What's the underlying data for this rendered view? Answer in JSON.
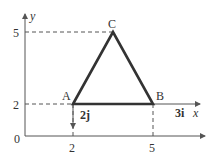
{
  "figure": {
    "axes": {
      "x_label": "x",
      "y_label": "y",
      "origin_label": "0",
      "x_ticks": [
        "2",
        "5"
      ],
      "y_ticks": [
        "2",
        "5"
      ]
    },
    "points": {
      "A": {
        "label": "A",
        "x": 2,
        "y": 2
      },
      "B": {
        "label": "B",
        "x": 5,
        "y": 2
      },
      "C": {
        "label": "C",
        "x": 3.5,
        "y": 5
      }
    },
    "vectors": {
      "i_vec": "3i",
      "j_vec": "2j"
    },
    "colors": {
      "triangle": "#333333",
      "axes": "#555555",
      "dashed": "#555555"
    }
  }
}
